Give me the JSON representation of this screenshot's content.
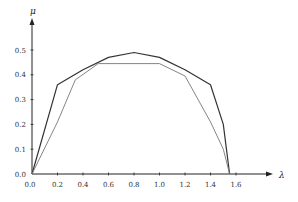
{
  "chart_data": {
    "type": "line",
    "title": "",
    "xlabel": "λ",
    "ylabel": "μ",
    "xlim": [
      0.0,
      1.7
    ],
    "ylim": [
      0.0,
      0.6
    ],
    "grid": false,
    "legend": null,
    "x_ticks": [
      "0.0",
      "0.2",
      "0.4",
      "0.6",
      "0.8",
      "1.0",
      "1.2",
      "1.4",
      "1.6"
    ],
    "y_ticks": [
      "0.0",
      "0.1",
      "0.2",
      "0.3",
      "0.4",
      "0.5"
    ],
    "series": [
      {
        "name": "outer-curve",
        "style": "dark",
        "x": [
          0.0,
          0.2,
          0.4,
          0.6,
          0.8,
          1.0,
          1.2,
          1.4,
          1.5,
          1.55
        ],
        "y": [
          0.0,
          0.36,
          0.42,
          0.47,
          0.49,
          0.47,
          0.42,
          0.36,
          0.2,
          0.0
        ]
      },
      {
        "name": "inner-polyline",
        "style": "light",
        "x": [
          0.0,
          0.2,
          0.34,
          0.52,
          1.0,
          1.2,
          1.4,
          1.5,
          1.55
        ],
        "y": [
          0.0,
          0.21,
          0.38,
          0.445,
          0.445,
          0.395,
          0.21,
          0.1,
          0.0
        ]
      }
    ]
  }
}
